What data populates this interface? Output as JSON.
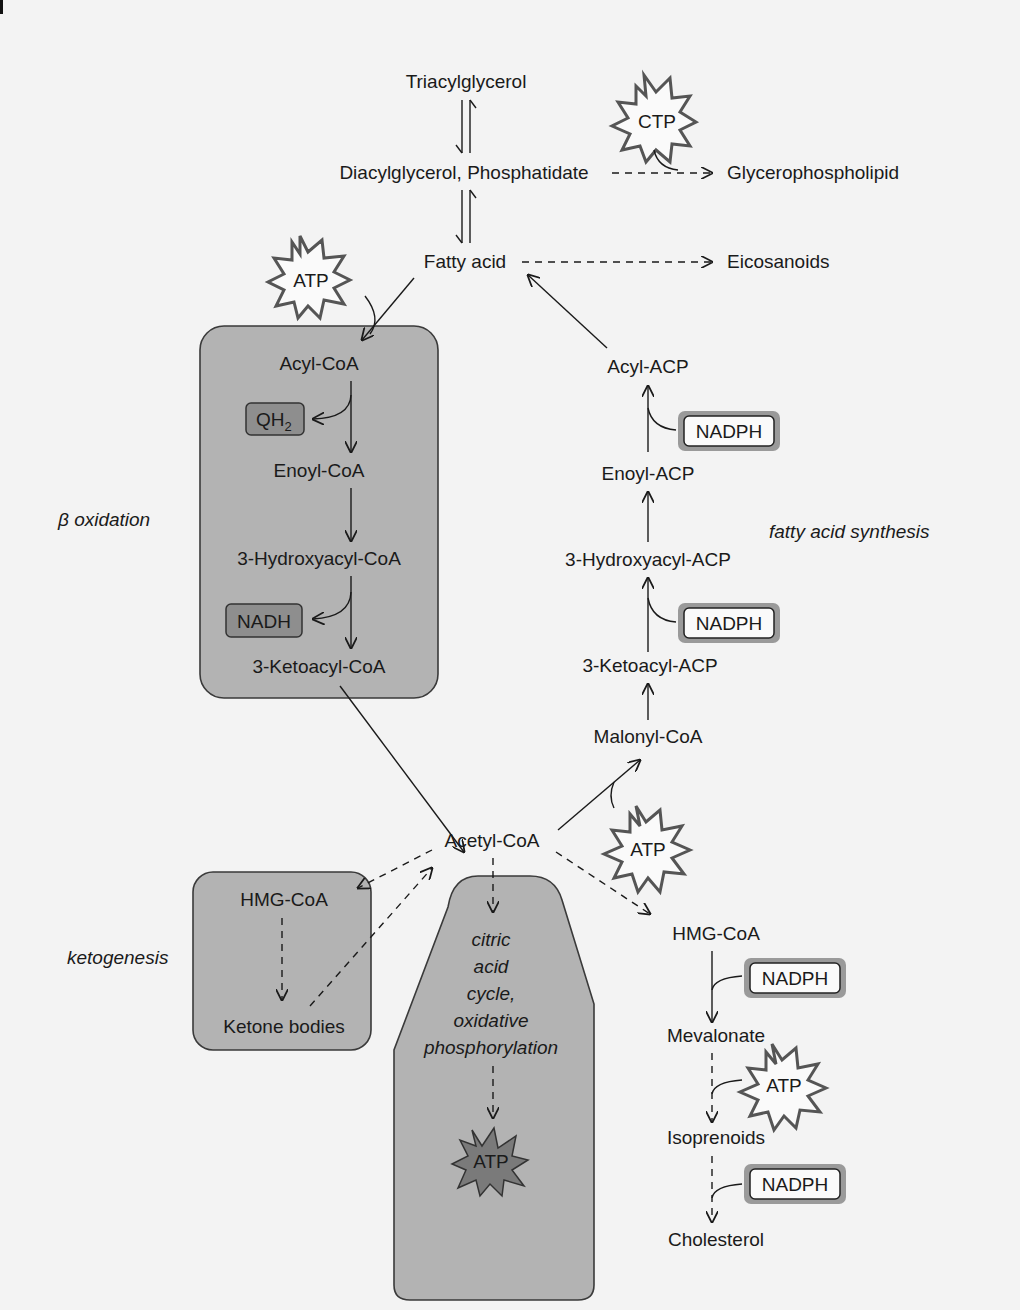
{
  "nodes": {
    "triacylglycerol": "Triacylglycerol",
    "diacylglycerol": "Diacylglycerol, Phosphatidate",
    "glycerophospholipid": "Glycerophospholipid",
    "fatty_acid": "Fatty acid",
    "eicosanoids": "Eicosanoids",
    "acyl_coa": "Acyl-CoA",
    "enoyl_coa": "Enoyl-CoA",
    "hydroxyacyl_coa": "3-Hydroxyacyl-CoA",
    "ketoacyl_coa": "3-Ketoacyl-CoA",
    "acyl_acp": "Acyl-ACP",
    "enoyl_acp": "Enoyl-ACP",
    "hydroxyacyl_acp": "3-Hydroxyacyl-ACP",
    "ketoacyl_acp": "3-Ketoacyl-ACP",
    "malonyl_coa": "Malonyl-CoA",
    "acetyl_coa": "Acetyl-CoA",
    "hmg_coa_keto": "HMG-CoA",
    "ketone_bodies": "Ketone bodies",
    "hmg_coa_chol": "HMG-CoA",
    "mevalonate": "Mevalonate",
    "isoprenoids": "Isoprenoids",
    "cholesterol": "Cholesterol"
  },
  "cofactors": {
    "ctp": "CTP",
    "atp_fatty_acid": "ATP",
    "qh2_main": "QH",
    "qh2_sub": "2",
    "nadh": "NADH",
    "nadph_acyl_acp": "NADPH",
    "nadph_hydroxyacyl_acp": "NADPH",
    "atp_malonyl": "ATP",
    "nadph_hmg": "NADPH",
    "atp_mevalonate": "ATP",
    "nadph_isoprenoids": "NADPH",
    "atp_citric": "ATP"
  },
  "pathways": {
    "beta_oxidation": "β oxidation",
    "fatty_acid_synthesis": "fatty acid synthesis",
    "ketogenesis": "ketogenesis",
    "citric_lines": [
      "citric",
      "acid",
      "cycle,",
      "oxidative",
      "phosphorylation"
    ]
  },
  "colors": {
    "page_background": "#f3f3f3",
    "pathway_box": "#b3b3b3",
    "dark_cofactor": "#8e8e8e",
    "text": "#1a1a1a"
  }
}
